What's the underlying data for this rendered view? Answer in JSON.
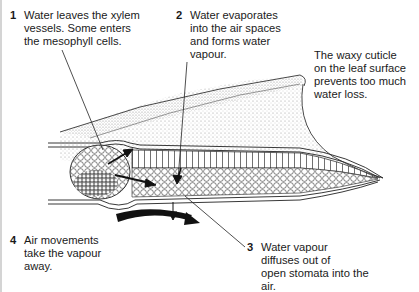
{
  "diagram": {
    "labels": [
      {
        "number": "1",
        "text": "Water leaves the xylem\nvessels. Some enters\nthe mesophyll cells."
      },
      {
        "number": "2",
        "text": "Water evaporates\ninto the air spaces\nand forms water\nvapour."
      },
      {
        "number": "",
        "text": "The waxy cuticle\non the leaf surface\nprevents too much\nwater loss."
      },
      {
        "number": "4",
        "text": "Air movements\ntake the vapour\naway."
      },
      {
        "number": "3",
        "text": "Water vapour\ndiffuses out of\nopen stomata into the\nair."
      }
    ],
    "colors": {
      "ink": "#1a1a1a",
      "stipple": "#b8b8b8",
      "edge": "#d4d4d4"
    }
  }
}
